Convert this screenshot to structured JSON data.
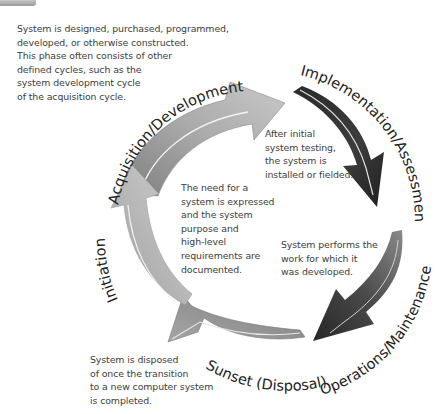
{
  "diagram": {
    "phases": [
      {
        "id": "acquisition",
        "label": "Acquisition/Development",
        "description": "System is designed, purchased, programmed,\ndeveloped, or otherwise constructed.\nThis phase often consists of other\ndefined cycles, such as the\nsystem development cycle\nof the acquisition cycle.",
        "color": "#a8a8a8"
      },
      {
        "id": "implementation",
        "label": "Implementation/Assessment",
        "description": "After initial\nsystem testing,\nthe system is\ninstalled or fielded.",
        "color": "#3a3a3a"
      },
      {
        "id": "operations",
        "label": "Operations/Maintenance",
        "description": "System performs the\nwork for which it\nwas developed.",
        "color": "#4a4a4a"
      },
      {
        "id": "sunset",
        "label": "Sunset (Disposal)",
        "description": "System is disposed\nof once the transition\nto a new computer system\nis completed.",
        "color": "#8e8e8e"
      },
      {
        "id": "initiation",
        "label": "Initiation",
        "description": "The need for a\nsystem is expressed\nand the system\npurpose and\nhigh-level\nrequirements are\ndocumented.",
        "color": "#b5b5b5"
      }
    ]
  }
}
